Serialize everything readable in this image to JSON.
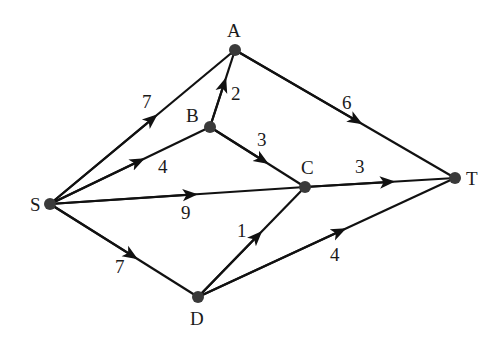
{
  "diagram": {
    "type": "directed-weighted-graph",
    "nodes": [
      {
        "id": "S",
        "label": "S",
        "x": 50,
        "y": 204,
        "lx": 30,
        "ly": 211
      },
      {
        "id": "A",
        "label": "A",
        "x": 235,
        "y": 50,
        "lx": 227,
        "ly": 37
      },
      {
        "id": "B",
        "label": "B",
        "x": 210,
        "y": 127,
        "lx": 186,
        "ly": 122
      },
      {
        "id": "C",
        "label": "C",
        "x": 305,
        "y": 187,
        "lx": 301,
        "ly": 174
      },
      {
        "id": "T",
        "label": "T",
        "x": 455,
        "y": 178,
        "lx": 466,
        "ly": 185
      },
      {
        "id": "D",
        "label": "D",
        "x": 198,
        "y": 297,
        "lx": 190,
        "ly": 325
      }
    ],
    "edges": [
      {
        "from": "S",
        "to": "A",
        "weight": "7",
        "wx": 142,
        "wy": 108
      },
      {
        "from": "S",
        "to": "B",
        "weight": "4",
        "wx": 158,
        "wy": 173
      },
      {
        "from": "S",
        "to": "C",
        "weight": "9",
        "wx": 181,
        "wy": 219
      },
      {
        "from": "S",
        "to": "D",
        "weight": "7",
        "wx": 115,
        "wy": 273
      },
      {
        "from": "B",
        "to": "A",
        "weight": "2",
        "wx": 231,
        "wy": 100
      },
      {
        "from": "B",
        "to": "C",
        "weight": "3",
        "wx": 257,
        "wy": 146
      },
      {
        "from": "A",
        "to": "T",
        "weight": "6",
        "wx": 342,
        "wy": 109
      },
      {
        "from": "C",
        "to": "T",
        "weight": "3",
        "wx": 355,
        "wy": 173
      },
      {
        "from": "D",
        "to": "C",
        "weight": "1",
        "wx": 237,
        "wy": 237
      },
      {
        "from": "D",
        "to": "T",
        "weight": "4",
        "wx": 330,
        "wy": 261
      }
    ],
    "colors": {
      "edge": "#111111",
      "node": "#3a3a3a",
      "text": "#1a1a1a",
      "background": "#ffffff"
    }
  }
}
